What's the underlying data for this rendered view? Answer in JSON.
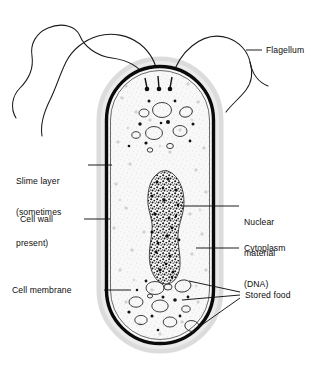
{
  "diagram": {
    "type": "labeled biological diagram",
    "background_color": "#ffffff",
    "ink_color": "#111111",
    "cytoplasm_fill": "#f7f7f7",
    "speckle_color": "#9a9a9a",
    "slime_color": "#d8d8d8"
  },
  "labels": {
    "flagellum": "Flagellum",
    "slime_layer_line1": "Slime layer",
    "slime_layer_line2": "(sometimes",
    "slime_layer_line3": "present)",
    "cell_wall": "Cell wall",
    "cell_membrane": "Cell membrane",
    "nuclear_line1": "Nuclear",
    "nuclear_line2": "material",
    "nuclear_line3": "(DNA)",
    "cytoplasm": "Cytoplasm",
    "stored_food": "Stored food"
  },
  "structures": [
    {
      "name": "flagellum",
      "count": 3,
      "description": "long wavy whip-like filaments emerging from the top of the cell"
    },
    {
      "name": "slime-layer",
      "description": "faint grey halo outside the cell wall, sometimes present"
    },
    {
      "name": "cell-wall",
      "description": "thick dark outer boundary of the rod-shaped cell"
    },
    {
      "name": "cell-membrane",
      "description": "thin line just inside the cell wall"
    },
    {
      "name": "nuclear-material-dna",
      "description": "irregular dense speckled nucleoid region in the centre of the cell"
    },
    {
      "name": "cytoplasm",
      "description": "finely stippled ground substance filling the cell"
    },
    {
      "name": "stored-food",
      "count": 3,
      "description": "oval granules and droplets grouped near the top and bottom of the cell"
    }
  ],
  "leader_lines": {
    "flagellum": "short horizontal tick from label to the right-hand flagellum",
    "slime_layer": "horizontal line from label to the outer halo at the left of the cell",
    "cell_wall": "horizontal line from label to the thick left wall of the cell",
    "cell_membrane": "horizontal line from label to the inner membrane at the lower-left of the cell",
    "nuclear_material": "horizontal line from label to the dark nucleoid blob",
    "cytoplasm": "horizontal line from label to a stippled area of cytoplasm",
    "stored_food": "three converging lines from label to three oval granules"
  }
}
